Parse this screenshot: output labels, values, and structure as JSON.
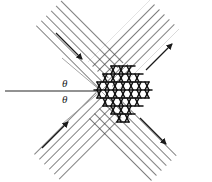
{
  "figure": {
    "name": "bragg-scattering-diagram",
    "width": 212,
    "height": 182,
    "background": "#ffffff",
    "ink_color": "#1a1a1a",
    "hatch_color": "#3a3a3a",
    "guide_color": "#8a8a8a"
  },
  "labels": {
    "theta_top": "θ",
    "theta_bottom": "θ"
  },
  "incident_ray": {
    "name": "incident-ray",
    "x1": 5,
    "y1": 91,
    "x2": 100,
    "y2": 91
  },
  "guides": [
    {
      "name": "guide-upper-plane",
      "x1": 62,
      "y1": 58,
      "x2": 100,
      "y2": 91
    },
    {
      "name": "guide-lower-plane",
      "x1": 62,
      "y1": 124,
      "x2": 100,
      "y2": 91
    }
  ],
  "crystal": {
    "name": "triangular-lattice-diamond",
    "cx": 123,
    "cy": 95,
    "half_width": 28,
    "half_height": 30,
    "rows": 7,
    "description": "triangular lattice of close-packed rows"
  },
  "arms": [
    {
      "name": "beam-arm-top-left",
      "angle_deg": -135,
      "hatch_dir": "forward-slash",
      "arrow": "inbound"
    },
    {
      "name": "beam-arm-top-right",
      "angle_deg": -45,
      "hatch_dir": "back-slash",
      "arrow": "outbound"
    },
    {
      "name": "beam-arm-bottom-left",
      "angle_deg": 135,
      "hatch_dir": "back-slash",
      "arrow": "inbound"
    },
    {
      "name": "beam-arm-bottom-right",
      "angle_deg": 45,
      "hatch_dir": "forward-slash",
      "arrow": "outbound"
    }
  ],
  "arrows": [
    {
      "name": "arrow-top-left",
      "x1": 58,
      "y1": 35,
      "x2": 82,
      "y2": 59
    },
    {
      "name": "arrow-top-right",
      "x1": 148,
      "y1": 68,
      "x2": 170,
      "y2": 46
    },
    {
      "name": "arrow-bottom-left",
      "x1": 44,
      "y1": 146,
      "x2": 68,
      "y2": 122
    },
    {
      "name": "arrow-bottom-right",
      "x1": 142,
      "y1": 120,
      "x2": 166,
      "y2": 144
    }
  ]
}
